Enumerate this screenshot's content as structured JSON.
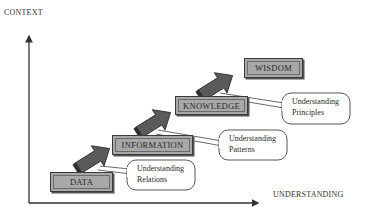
{
  "diagram": {
    "axes": {
      "y_label": "CONTEXT",
      "x_label": "UNDERSTANDING"
    },
    "stages": [
      {
        "id": "data",
        "label": "DATA",
        "callout": null
      },
      {
        "id": "information",
        "label": "INFORMATION",
        "callout": {
          "line1": "Understanding",
          "line2": "Relations"
        }
      },
      {
        "id": "knowledge",
        "label": "KNOWLEDGE",
        "callout": {
          "line1": "Understanding",
          "line2": "Patterns"
        }
      },
      {
        "id": "wisdom",
        "label": "WISDOM",
        "callout": {
          "line1": "Understanding",
          "line2": "Principles"
        }
      }
    ],
    "transitions": [
      {
        "from": "DATA",
        "to": "INFORMATION",
        "callout_line1": "Understanding",
        "callout_line2": "Relations"
      },
      {
        "from": "INFORMATION",
        "to": "KNOWLEDGE",
        "callout_line1": "Understanding",
        "callout_line2": "Patterns"
      },
      {
        "from": "KNOWLEDGE",
        "to": "WISDOM",
        "callout_line1": "Understanding",
        "callout_line2": "Principles"
      }
    ],
    "colors": {
      "box_fill": "#a8a8a8",
      "box_border": "#3a3a3a",
      "arrow_fill": "#5a5a5a",
      "axis": "#333333",
      "background": "#ffffff"
    }
  }
}
